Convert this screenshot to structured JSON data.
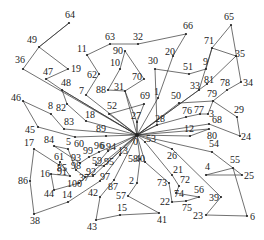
{
  "diagram": {
    "type": "vehicle-routing-solution",
    "depot": {
      "id": "0",
      "x": 137,
      "y": 135
    },
    "colors": {
      "edge": "#333333",
      "node": "#222222",
      "label": "#222222",
      "background": "#ffffff"
    },
    "nodes": [
      {
        "id": "64",
        "x": 69,
        "y": 23,
        "lx": -4,
        "ly": -5
      },
      {
        "id": "49",
        "x": 39,
        "y": 47,
        "lx": -12,
        "ly": -4
      },
      {
        "id": "36",
        "x": 23,
        "y": 69,
        "lx": -8,
        "ly": -6
      },
      {
        "id": "19",
        "x": 68,
        "y": 69,
        "lx": 3,
        "ly": 3
      },
      {
        "id": "47",
        "x": 46,
        "y": 79,
        "lx": -3,
        "ly": -4
      },
      {
        "id": "48",
        "x": 62,
        "y": 90,
        "lx": -1,
        "ly": -4
      },
      {
        "id": "11",
        "x": 87,
        "y": 55,
        "lx": -10,
        "ly": -3
      },
      {
        "id": "63",
        "x": 110,
        "y": 44,
        "lx": -5,
        "ly": -4
      },
      {
        "id": "32",
        "x": 138,
        "y": 44,
        "lx": -5,
        "ly": -4
      },
      {
        "id": "66",
        "x": 186,
        "y": 34,
        "lx": -3,
        "ly": -5
      },
      {
        "id": "90",
        "x": 125,
        "y": 51,
        "lx": -12,
        "ly": 3
      },
      {
        "id": "10",
        "x": 120,
        "y": 69,
        "lx": -10,
        "ly": -3
      },
      {
        "id": "62",
        "x": 99,
        "y": 74,
        "lx": -12,
        "ly": 4
      },
      {
        "id": "7",
        "x": 86,
        "y": 95,
        "lx": -7,
        "ly": -1
      },
      {
        "id": "88",
        "x": 108,
        "y": 90,
        "lx": -12,
        "ly": 3
      },
      {
        "id": "31",
        "x": 125,
        "y": 91,
        "lx": -11,
        "ly": -1
      },
      {
        "id": "70",
        "x": 144,
        "y": 79,
        "lx": -12,
        "ly": 1
      },
      {
        "id": "69",
        "x": 144,
        "y": 104,
        "lx": -4,
        "ly": -5
      },
      {
        "id": "52",
        "x": 109,
        "y": 114,
        "lx": -2,
        "ly": -5
      },
      {
        "id": "27",
        "x": 137,
        "y": 122,
        "lx": -6,
        "ly": -3
      },
      {
        "id": "20",
        "x": 173,
        "y": 56,
        "lx": -8,
        "ly": -1
      },
      {
        "id": "30",
        "x": 155,
        "y": 69,
        "lx": -7,
        "ly": -5
      },
      {
        "id": "51",
        "x": 189,
        "y": 74,
        "lx": -6,
        "ly": -4
      },
      {
        "id": "9",
        "x": 206,
        "y": 69,
        "lx": -3,
        "ly": -4
      },
      {
        "id": "71",
        "x": 212,
        "y": 48,
        "lx": -8,
        "ly": -4
      },
      {
        "id": "65",
        "x": 231,
        "y": 25,
        "lx": -7,
        "ly": -5
      },
      {
        "id": "35",
        "x": 236,
        "y": 56,
        "lx": -1,
        "ly": 1
      },
      {
        "id": "34",
        "x": 241,
        "y": 82,
        "lx": 2,
        "ly": 4
      },
      {
        "id": "78",
        "x": 227,
        "y": 90,
        "lx": -7,
        "ly": -4
      },
      {
        "id": "33",
        "x": 199,
        "y": 90,
        "lx": -9,
        "ly": -1
      },
      {
        "id": "81",
        "x": 207,
        "y": 84,
        "lx": -3,
        "ly": -1
      },
      {
        "id": "1",
        "x": 158,
        "y": 98,
        "lx": -4,
        "ly": -3
      },
      {
        "id": "50",
        "x": 179,
        "y": 103,
        "lx": -8,
        "ly": -4
      },
      {
        "id": "79",
        "x": 213,
        "y": 101,
        "lx": -6,
        "ly": -4
      },
      {
        "id": "76",
        "x": 186,
        "y": 117,
        "lx": -4,
        "ly": -3
      },
      {
        "id": "77",
        "x": 200,
        "y": 114,
        "lx": -6,
        "ly": -1
      },
      {
        "id": "3",
        "x": 208,
        "y": 114,
        "lx": 1,
        "ly": 3
      },
      {
        "id": "29",
        "x": 237,
        "y": 117,
        "lx": -3,
        "ly": -4
      },
      {
        "id": "68",
        "x": 209,
        "y": 124,
        "lx": 3,
        "ly": -1
      },
      {
        "id": "24",
        "x": 240,
        "y": 136,
        "lx": 1,
        "ly": 4
      },
      {
        "id": "12",
        "x": 190,
        "y": 136,
        "lx": -6,
        "ly": -4
      },
      {
        "id": "80",
        "x": 209,
        "y": 129,
        "lx": -2,
        "ly": 10
      },
      {
        "id": "28",
        "x": 157,
        "y": 125,
        "lx": -2,
        "ly": -3
      },
      {
        "id": "46",
        "x": 23,
        "y": 101,
        "lx": -12,
        "ly": 0
      },
      {
        "id": "8",
        "x": 51,
        "y": 114,
        "lx": -3,
        "ly": -5
      },
      {
        "id": "82",
        "x": 67,
        "y": 104,
        "lx": -11,
        "ly": 7
      },
      {
        "id": "18",
        "x": 86,
        "y": 121,
        "lx": -1,
        "ly": -3
      },
      {
        "id": "83",
        "x": 64,
        "y": 129,
        "lx": 0,
        "ly": -4
      },
      {
        "id": "45",
        "x": 38,
        "y": 127,
        "lx": -13,
        "ly": 6
      },
      {
        "id": "89",
        "x": 106,
        "y": 136,
        "lx": -10,
        "ly": -4
      },
      {
        "id": "60",
        "x": 75,
        "y": 137,
        "lx": -1,
        "ly": 10
      },
      {
        "id": "54",
        "x": 212,
        "y": 152,
        "lx": -3,
        "ly": -5
      },
      {
        "id": "55",
        "x": 233,
        "y": 168,
        "lx": -3,
        "ly": -5
      },
      {
        "id": "4",
        "x": 206,
        "y": 175,
        "lx": -1,
        "ly": -5
      },
      {
        "id": "25",
        "x": 242,
        "y": 175,
        "lx": 2,
        "ly": 4
      },
      {
        "id": "6",
        "x": 247,
        "y": 216,
        "lx": 3,
        "ly": 4
      },
      {
        "id": "23",
        "x": 206,
        "y": 215,
        "lx": -13,
        "ly": 4
      },
      {
        "id": "39",
        "x": 221,
        "y": 197,
        "lx": -12,
        "ly": 4
      },
      {
        "id": "26",
        "x": 172,
        "y": 149,
        "lx": -5,
        "ly": 10
      },
      {
        "id": "53",
        "x": 145,
        "y": 142,
        "lx": 1,
        "ly": 0
      },
      {
        "id": "21",
        "x": 172,
        "y": 175,
        "lx": 1,
        "ly": -2
      },
      {
        "id": "72",
        "x": 179,
        "y": 186,
        "lx": 1,
        "ly": -3
      },
      {
        "id": "74",
        "x": 176,
        "y": 193,
        "lx": -2,
        "ly": 4
      },
      {
        "id": "56",
        "x": 199,
        "y": 197,
        "lx": -5,
        "ly": -4
      },
      {
        "id": "75",
        "x": 186,
        "y": 201,
        "lx": -4,
        "ly": 10
      },
      {
        "id": "22",
        "x": 172,
        "y": 202,
        "lx": -12,
        "ly": 3
      },
      {
        "id": "73",
        "x": 169,
        "y": 183,
        "lx": -12,
        "ly": 3
      },
      {
        "id": "40",
        "x": 145,
        "y": 162,
        "lx": -10,
        "ly": 0
      },
      {
        "id": "58",
        "x": 140,
        "y": 159,
        "lx": -12,
        "ly": 3
      },
      {
        "id": "2",
        "x": 137,
        "y": 183,
        "lx": -8,
        "ly": 1
      },
      {
        "id": "57",
        "x": 128,
        "y": 196,
        "lx": -12,
        "ly": 3
      },
      {
        "id": "41",
        "x": 159,
        "y": 213,
        "lx": -2,
        "ly": 10
      },
      {
        "id": "15",
        "x": 120,
        "y": 215,
        "lx": -3,
        "ly": -4
      },
      {
        "id": "43",
        "x": 96,
        "y": 220,
        "lx": -9,
        "ly": 10
      },
      {
        "id": "42",
        "x": 100,
        "y": 197,
        "lx": -12,
        "ly": -1
      },
      {
        "id": "87",
        "x": 114,
        "y": 180,
        "lx": -6,
        "ly": 10
      },
      {
        "id": "13",
        "x": 120,
        "y": 155,
        "lx": -2,
        "ly": -1
      },
      {
        "id": "17",
        "x": 34,
        "y": 149,
        "lx": -10,
        "ly": -3
      },
      {
        "id": "86",
        "x": 30,
        "y": 181,
        "lx": -12,
        "ly": 3
      },
      {
        "id": "38",
        "x": 34,
        "y": 214,
        "lx": -4,
        "ly": 10
      },
      {
        "id": "14",
        "x": 68,
        "y": 202,
        "lx": -6,
        "ly": -4
      },
      {
        "id": "44",
        "x": 54,
        "y": 190,
        "lx": -10,
        "ly": 7
      },
      {
        "id": "16",
        "x": 51,
        "y": 174,
        "lx": -11,
        "ly": 3
      },
      {
        "id": "84",
        "x": 54,
        "y": 146,
        "lx": -10,
        "ly": -3
      },
      {
        "id": "5",
        "x": 68,
        "y": 149,
        "lx": -2,
        "ly": -4
      },
      {
        "id": "61",
        "x": 60,
        "y": 162,
        "lx": -6,
        "ly": -2
      },
      {
        "id": "85",
        "x": 59,
        "y": 165,
        "lx": -2,
        "ly": 6
      },
      {
        "id": "91",
        "x": 70,
        "y": 176,
        "lx": -13,
        "ly": -1
      },
      {
        "id": "93",
        "x": 80,
        "y": 163,
        "lx": -9,
        "ly": -2
      },
      {
        "id": "99",
        "x": 89,
        "y": 157,
        "lx": -6,
        "ly": -3
      },
      {
        "id": "96",
        "x": 99,
        "y": 152,
        "lx": -5,
        "ly": -3
      },
      {
        "id": "94",
        "x": 108,
        "y": 151,
        "lx": -2,
        "ly": -1
      },
      {
        "id": "98",
        "x": 76,
        "y": 170,
        "lx": -5,
        "ly": -1
      },
      {
        "id": "59",
        "x": 96,
        "y": 165,
        "lx": -4,
        "ly": -1
      },
      {
        "id": "95",
        "x": 104,
        "y": 166,
        "lx": 0,
        "ly": -1
      },
      {
        "id": "92",
        "x": 93,
        "y": 176,
        "lx": -7,
        "ly": -1
      },
      {
        "id": "37",
        "x": 85,
        "y": 177,
        "lx": -6,
        "ly": 4
      },
      {
        "id": "100",
        "x": 79,
        "y": 183,
        "lx": -12,
        "ly": 4
      },
      {
        "id": "97",
        "x": 100,
        "y": 181,
        "lx": 0,
        "ly": -1
      }
    ],
    "extra_labels": [
      {
        "text": "6",
        "x": 100,
        "y": 149
      }
    ],
    "routes": [
      [
        "0",
        "36",
        "49",
        "64",
        "49",
        "19",
        "47",
        "48",
        "0"
      ],
      [
        "0",
        "7",
        "62",
        "11",
        "63",
        "32",
        "66",
        "20",
        "1",
        "0"
      ],
      [
        "0",
        "31",
        "88",
        "10",
        "90",
        "70",
        "31",
        "27",
        "0"
      ],
      [
        "0",
        "52",
        "69",
        "27",
        "0"
      ],
      [
        "0",
        "28",
        "30",
        "51",
        "9",
        "71",
        "33",
        "0"
      ],
      [
        "0",
        "81",
        "35",
        "71",
        "65",
        "34",
        "78",
        "79",
        "50",
        "0"
      ],
      [
        "0",
        "28",
        "76",
        "77",
        "3",
        "79",
        "29",
        "24",
        "68",
        "0"
      ],
      [
        "0",
        "12",
        "80",
        "0"
      ],
      [
        "0",
        "54",
        "55",
        "4",
        "25",
        "55",
        "6",
        "23",
        "39",
        "26",
        "0"
      ],
      [
        "0",
        "53",
        "21",
        "72",
        "74",
        "56",
        "75",
        "22",
        "73",
        "40",
        "0"
      ],
      [
        "0",
        "58",
        "2",
        "57",
        "41",
        "15",
        "43",
        "42",
        "87",
        "0"
      ],
      [
        "0",
        "13",
        "97",
        "14",
        "38",
        "86",
        "17",
        "85",
        "61",
        "91",
        "16",
        "44",
        "100",
        "0"
      ],
      [
        "0",
        "89",
        "60",
        "45",
        "46",
        "8",
        "83",
        "0"
      ],
      [
        "0",
        "18",
        "82",
        "48",
        "0"
      ],
      [
        "0",
        "96",
        "99",
        "93",
        "84",
        "5",
        "98",
        "37",
        "92",
        "0"
      ],
      [
        "0",
        "94",
        "59",
        "95",
        "0"
      ]
    ]
  }
}
